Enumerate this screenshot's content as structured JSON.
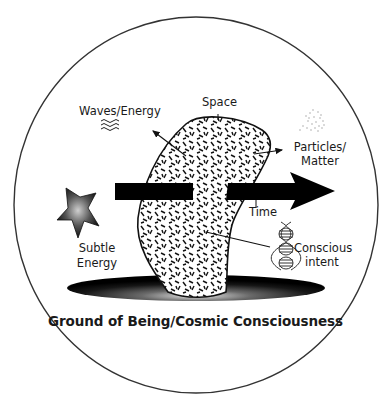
{
  "diagram": {
    "title": "Ground of Being/Cosmic Consciousness",
    "labels": {
      "space": "Space",
      "waves_energy": "Waves/Energy",
      "particles_line1": "Particles/",
      "particles_line2": "Matter",
      "time": "Time",
      "subtle_line1": "Subtle",
      "subtle_line2": "Energy",
      "conscious_line1": "Conscious",
      "conscious_line2": "intent"
    },
    "colors": {
      "ink": "#1a1a1a",
      "outline": "#333333",
      "background": "#ffffff"
    },
    "nodes": [
      {
        "id": "ground",
        "label": "Ground of Being/Cosmic Consciousness",
        "shape": "dark radial ellipse"
      },
      {
        "id": "space",
        "label": "Space",
        "shape": "textured curved slab"
      },
      {
        "id": "waves",
        "label": "Waves/Energy",
        "icon": "wave-icon"
      },
      {
        "id": "particles",
        "label": "Particles/Matter",
        "icon": "particle-cloud-icon"
      },
      {
        "id": "time",
        "label": "Time",
        "shape": "thick arrow pointing right"
      },
      {
        "id": "subtle",
        "label": "Subtle Energy",
        "icon": "star-icon"
      },
      {
        "id": "conscious",
        "label": "Conscious intent",
        "icon": "dna-helix-icon"
      }
    ],
    "edges": [
      {
        "from": "space",
        "to": "waves",
        "type": "arrow"
      },
      {
        "from": "space",
        "to": "particles",
        "type": "arrow"
      },
      {
        "from": "space",
        "to": "conscious",
        "type": "line"
      },
      {
        "from": "time",
        "to": "time-label",
        "type": "tick"
      }
    ]
  }
}
